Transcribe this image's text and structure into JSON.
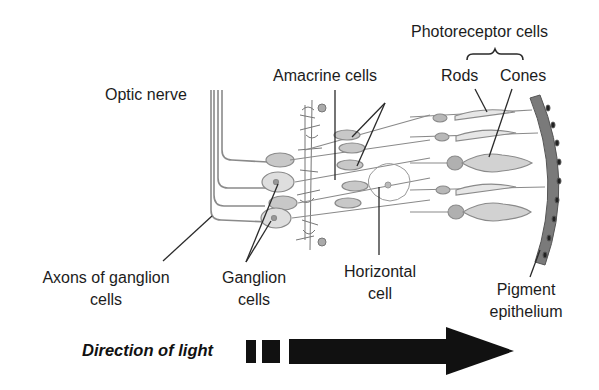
{
  "diagram": {
    "labels": {
      "photoreceptor_cells": "Photoreceptor cells",
      "rods": "Rods",
      "cones": "Cones",
      "amacrine_cells": "Amacrine cells",
      "optic_nerve": "Optic nerve",
      "axons_line1": "Axons of ganglion",
      "axons_line2": "cells",
      "ganglion_line1": "Ganglion",
      "ganglion_line2": "cells",
      "horizontal_line1": "Horizontal",
      "horizontal_line2": "cell",
      "pigment_line1": "Pigment",
      "pigment_line2": "epithelium"
    },
    "arrow": {
      "label": "Direction of light",
      "icon": "right-arrow-icon"
    },
    "colors": {
      "ink": "#1c1c1c",
      "cell_fill": "#c8c8c8",
      "cell_fill_light": "#dedede",
      "fiber": "#8a8a8a",
      "epithelium": "#7a7a7a",
      "arrow": "#111111"
    }
  }
}
